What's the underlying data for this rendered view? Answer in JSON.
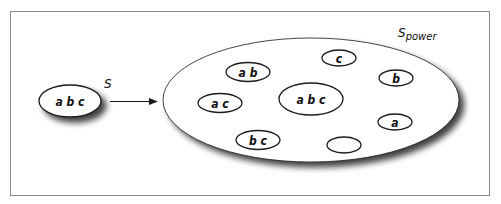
{
  "diagram": {
    "source_set": {
      "label": "S",
      "elements": "a b c"
    },
    "power_set": {
      "label_main": "S",
      "label_sub": "power",
      "subsets": [
        {
          "id": "ab",
          "text": "a b"
        },
        {
          "id": "c",
          "text": "c"
        },
        {
          "id": "b",
          "text": "b"
        },
        {
          "id": "ac",
          "text": "a c"
        },
        {
          "id": "abc",
          "text": "a b c"
        },
        {
          "id": "a",
          "text": "a"
        },
        {
          "id": "bc",
          "text": "b c"
        },
        {
          "id": "empty",
          "text": ""
        }
      ]
    },
    "colors": {
      "stroke": "#1a1a1a",
      "frame": "#8a8a8a",
      "fill": "#ffffff",
      "shadow": "#555555"
    }
  }
}
